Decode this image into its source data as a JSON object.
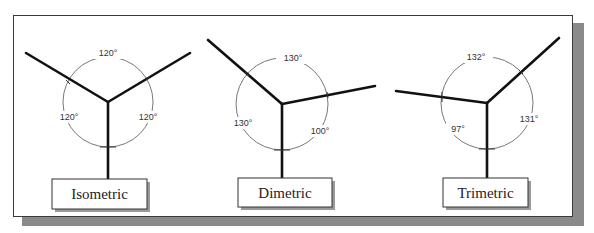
{
  "figure": {
    "panels": [
      {
        "name": "Isometric",
        "label": "Isometric",
        "angles": {
          "top": "120°",
          "left": "120°",
          "right": "120°"
        }
      },
      {
        "name": "Dimetric",
        "label": "Dimetric",
        "angles": {
          "top": "130°",
          "left": "130°",
          "right": "100°"
        }
      },
      {
        "name": "Trimetric",
        "label": "Trimetric",
        "angles": {
          "top": "132°",
          "left": "97°",
          "right": "131°"
        }
      }
    ]
  }
}
